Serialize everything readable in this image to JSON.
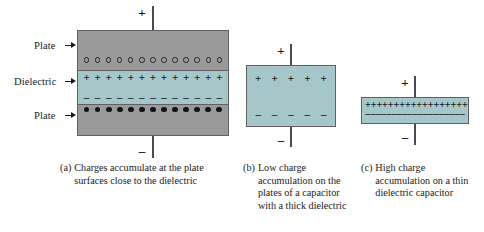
{
  "figure": {
    "title_present": false,
    "background_color": "#ffffff"
  },
  "colors": {
    "plate_gray": "#9a9a9a",
    "dielectric_teal": "#a6c7c9",
    "outline": "#5f5f66",
    "wire": "#4a4a52",
    "symbol_black": "#141418",
    "text": "#1a1a1a"
  },
  "side_labels": [
    {
      "text": "Plate",
      "target": "top-plate"
    },
    {
      "text": "Dielectric",
      "target": "dielectric-layer"
    },
    {
      "text": "Plate",
      "target": "bottom-plate"
    }
  ],
  "panel_a": {
    "top_terminal_sign": "+",
    "bottom_terminal_sign": "–",
    "rows": [
      {
        "kind": "open-circle",
        "count": 13,
        "symbol": ""
      },
      {
        "kind": "plus",
        "count": 13,
        "symbol": "+"
      },
      {
        "kind": "minus",
        "count": 13,
        "symbol": "–"
      },
      {
        "kind": "filled-circle",
        "count": 13,
        "symbol": ""
      }
    ],
    "caption_label": "(a)",
    "caption_text": "Charges accumulate at the plate surfaces close to the dielectric"
  },
  "panel_b": {
    "top_terminal_sign": "+",
    "bottom_terminal_sign": "–",
    "rows": [
      {
        "kind": "plus",
        "count": 5,
        "symbol": "+"
      },
      {
        "kind": "minus",
        "count": 5,
        "symbol": "–"
      }
    ],
    "caption_label": "(b)",
    "caption_text": "Low charge accumulation on the plates of a capacitor with a thick dielectric"
  },
  "panel_c": {
    "top_terminal_sign": "+",
    "bottom_terminal_sign": "–",
    "rows": [
      {
        "kind": "plus",
        "count": 19,
        "symbol": "+"
      },
      {
        "kind": "minus",
        "count": 19,
        "symbol": "–"
      }
    ],
    "caption_label": "(c)",
    "caption_text": "High charge accumulation on a thin dielectric capacitor"
  }
}
